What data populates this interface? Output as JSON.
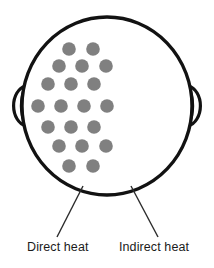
{
  "figure": {
    "type": "anatomical-schematic",
    "view": "top-of-head"
  },
  "colors": {
    "outline": "#121212",
    "dot": "#808080",
    "leader_line": "#2b2b2b",
    "text": "#1b1b1b",
    "background": "#ffffff"
  },
  "head": {
    "outline_name": "head-outline",
    "center_x": 107,
    "center_y": 106,
    "radius_x": 85,
    "radius_y": 89,
    "stroke_width": 3.4,
    "ears": [
      {
        "name": "left-ear",
        "side": "left"
      },
      {
        "name": "right-ear",
        "side": "right"
      }
    ]
  },
  "dots": {
    "name": "heat-dot",
    "count": 20,
    "radius": 6.8,
    "fill": "#808080",
    "rows": [
      {
        "row": 1,
        "count": 2,
        "y": 49,
        "xs": [
          69,
          93
        ]
      },
      {
        "row": 2,
        "count": 3,
        "y": 66,
        "xs": [
          59,
          82,
          106
        ]
      },
      {
        "row": 3,
        "count": 3,
        "y": 84,
        "xs": [
          48,
          71,
          94
        ]
      },
      {
        "row": 4,
        "count": 4,
        "y": 106,
        "xs": [
          38,
          61,
          84,
          107
        ]
      },
      {
        "row": 5,
        "count": 3,
        "y": 127,
        "xs": [
          48,
          71,
          94
        ]
      },
      {
        "row": 6,
        "count": 3,
        "y": 146,
        "xs": [
          59,
          82,
          106
        ]
      },
      {
        "row": 7,
        "count": 2,
        "y": 166,
        "xs": [
          69,
          93
        ]
      }
    ]
  },
  "leaders": [
    {
      "name": "leader-line-direct-heat",
      "x1": 83,
      "y1": 186,
      "x2": 57,
      "y2": 237
    },
    {
      "name": "leader-line-indirect-heat",
      "x1": 131,
      "y1": 186,
      "x2": 158,
      "y2": 237
    }
  ],
  "labels": {
    "direct_heat": "Direct heat",
    "indirect_heat": "Indirect heat"
  }
}
